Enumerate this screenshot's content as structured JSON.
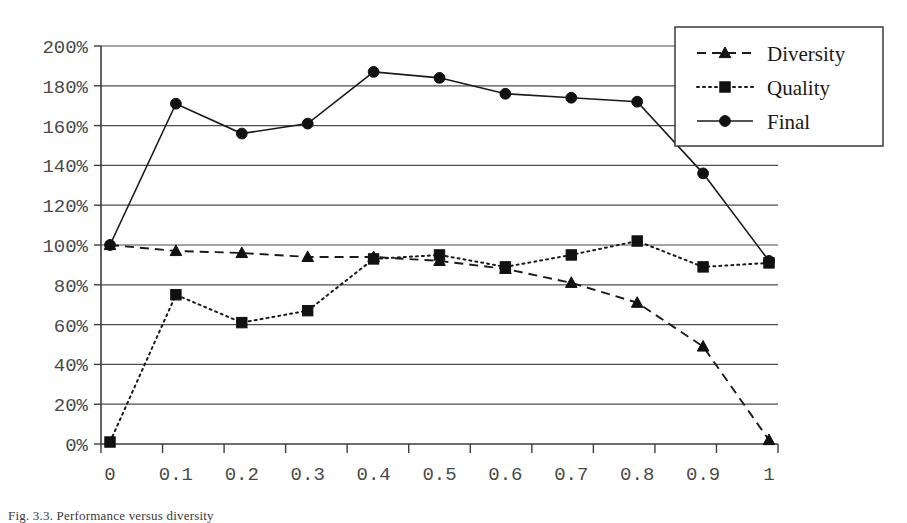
{
  "caption": "Fig. 3.3. Performance versus diversity",
  "chart_data": {
    "type": "line",
    "title": "",
    "xlabel": "",
    "ylabel": "",
    "x": [
      0,
      0.1,
      0.2,
      0.3,
      0.4,
      0.5,
      0.6,
      0.7,
      0.8,
      0.9,
      1
    ],
    "categories": [
      "0",
      "0.1",
      "0.2",
      "0.3",
      "0.4",
      "0.5",
      "0.6",
      "0.7",
      "0.8",
      "0.9",
      "1"
    ],
    "ylim": [
      0,
      200
    ],
    "yticks": [
      0,
      20,
      40,
      60,
      80,
      100,
      120,
      140,
      160,
      180,
      200
    ],
    "ytick_labels": [
      "0%",
      "20%",
      "40%",
      "60%",
      "80%",
      "100%",
      "120%",
      "140%",
      "160%",
      "180%",
      "200%"
    ],
    "y_unit": "%",
    "grid": true,
    "grid_axis": "y",
    "legend_position": "top-right",
    "series": [
      {
        "name": "Diversity",
        "marker": "triangle",
        "line_style": "dashed",
        "color": "#111111",
        "values": [
          100,
          97,
          96,
          94,
          94,
          92,
          88,
          81,
          71,
          49,
          2
        ]
      },
      {
        "name": "Quality",
        "marker": "square",
        "line_style": "dotted",
        "color": "#111111",
        "values": [
          1,
          75,
          61,
          67,
          93,
          95,
          89,
          95,
          102,
          89,
          91
        ]
      },
      {
        "name": "Final",
        "marker": "circle",
        "line_style": "solid",
        "color": "#111111",
        "values": [
          100,
          171,
          156,
          161,
          187,
          184,
          176,
          174,
          172,
          136,
          92
        ]
      }
    ]
  }
}
